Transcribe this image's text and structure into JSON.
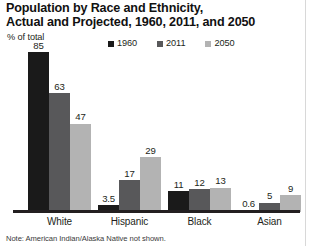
{
  "title": {
    "line1": "Population by Race and Ethnicity,",
    "line2": "Actual and Projected, 1960, 2011, and 2050"
  },
  "axis_unit": "% of total",
  "footnote": "Note: American Indian/Alaska Native not shown.",
  "colors": {
    "series_1960": "#1a1a1a",
    "series_2011": "#58585a",
    "series_2050": "#b3b3b3",
    "text": "#231f20",
    "baseline": "#231f20"
  },
  "chart_data": {
    "type": "bar",
    "title": "Population by Race and Ethnicity, Actual and Projected, 1960, 2011, and 2050",
    "xlabel": "",
    "ylabel": "% of total",
    "ylim": [
      0,
      85
    ],
    "grid": false,
    "legend_position": "top",
    "categories": [
      "White",
      "Hispanic",
      "Black",
      "Asian"
    ],
    "series": [
      {
        "name": "1960",
        "color": "#1a1a1a",
        "values": [
          85,
          3.5,
          11,
          0.6
        ],
        "labels": [
          "85",
          "3.5",
          "11",
          "0.6"
        ]
      },
      {
        "name": "2011",
        "color": "#58585a",
        "values": [
          63,
          17,
          12,
          5
        ],
        "labels": [
          "63",
          "17",
          "12",
          "5"
        ]
      },
      {
        "name": "2050",
        "color": "#b3b3b3",
        "values": [
          47,
          29,
          13,
          9
        ],
        "labels": [
          "47",
          "29",
          "13",
          "9"
        ]
      }
    ],
    "note": "Note: American Indian/Alaska Native not shown."
  }
}
